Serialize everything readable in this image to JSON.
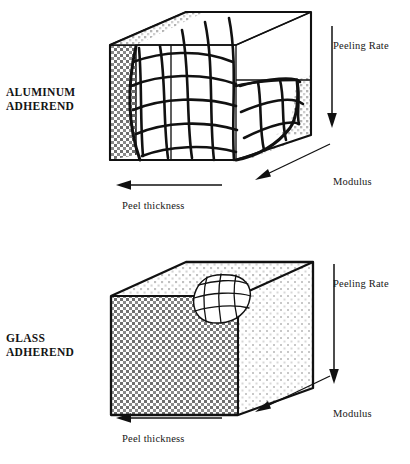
{
  "figure": {
    "type": "technical-diagram",
    "panels": [
      {
        "id": "aluminum",
        "adherend_label_line1": "ALUMINUM",
        "adherend_label_line2": "ADHEREND",
        "axes": [
          {
            "name": "peeling-rate",
            "label": "Peeling Rate",
            "direction": "down"
          },
          {
            "name": "modulus",
            "label": "Modulus",
            "direction": "down-left"
          },
          {
            "name": "peel-thickness",
            "label": "Peel thickness",
            "direction": "left"
          }
        ],
        "region_note": "Large crack-pattern mesh covering most of the block interior"
      },
      {
        "id": "glass",
        "adherend_label_line1": "GLASS",
        "adherend_label_line2": "ADHEREND",
        "axes": [
          {
            "name": "peeling-rate",
            "label": "Peeling Rate",
            "direction": "down"
          },
          {
            "name": "modulus",
            "label": "Modulus",
            "direction": "down-left"
          },
          {
            "name": "peel-thickness",
            "label": "Peel thickness",
            "direction": "left"
          }
        ],
        "region_note": "Small crack-pattern mesh patch near the top rear corner of the block"
      }
    ],
    "colors": {
      "ink": "#111111",
      "background": "#ffffff",
      "stipple_front": "#808080",
      "stipple_side": "#c9c9c9",
      "stipple_top": "#d8d8d8"
    }
  }
}
